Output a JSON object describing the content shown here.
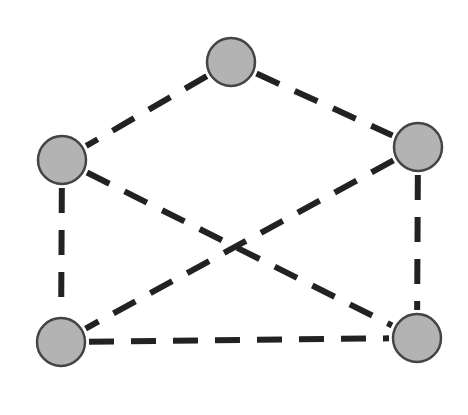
{
  "diagram": {
    "type": "graph",
    "style": {
      "edge_color": "#222222",
      "edge_width": 6,
      "edge_dash": "25 17",
      "node_fill": "#b3b3b3",
      "node_stroke": "#444444",
      "node_radius": 24
    },
    "nodes": [
      {
        "id": "top",
        "x": 231,
        "y": 62
      },
      {
        "id": "left",
        "x": 62,
        "y": 160
      },
      {
        "id": "right",
        "x": 418,
        "y": 147
      },
      {
        "id": "bottom-left",
        "x": 61,
        "y": 342
      },
      {
        "id": "bottom-right",
        "x": 417,
        "y": 338
      }
    ],
    "edges": [
      {
        "from": "top",
        "to": "left"
      },
      {
        "from": "top",
        "to": "right"
      },
      {
        "from": "left",
        "to": "bottom-left"
      },
      {
        "from": "left",
        "to": "bottom-right"
      },
      {
        "from": "right",
        "to": "bottom-left"
      },
      {
        "from": "right",
        "to": "bottom-right"
      },
      {
        "from": "bottom-left",
        "to": "bottom-right"
      }
    ]
  }
}
